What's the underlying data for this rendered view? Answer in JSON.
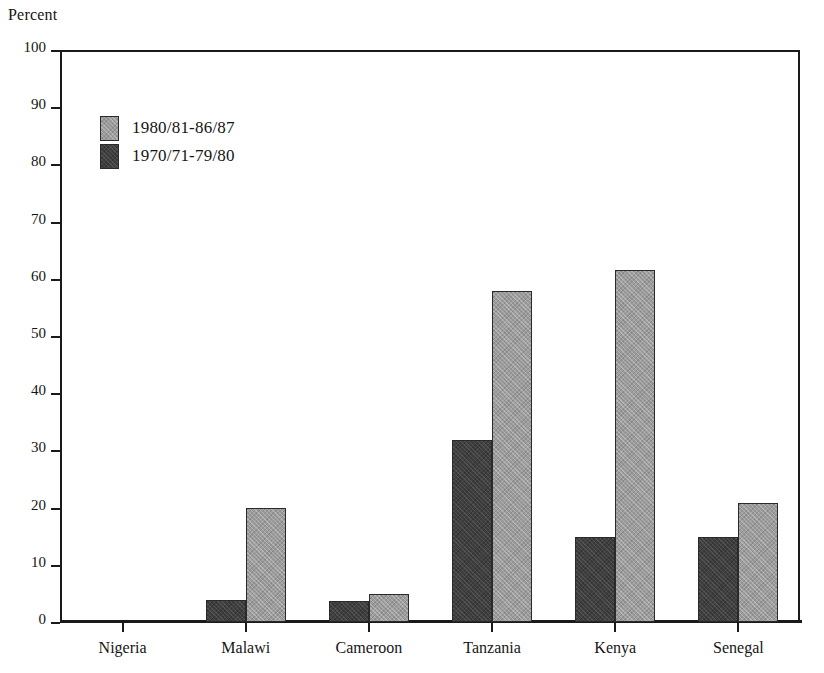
{
  "chart_data": {
    "type": "bar",
    "title": "",
    "subtitle": "",
    "ylabel": "Percent",
    "xlabel": "",
    "ylim": [
      0,
      100
    ],
    "ytick_step": 10,
    "yticks": [
      0,
      10,
      20,
      30,
      40,
      50,
      60,
      70,
      80,
      90,
      100
    ],
    "grid": false,
    "legend_position": "upper-left-inside",
    "categories": [
      "Nigeria",
      "Malawi",
      "Cameroon",
      "Tanzania",
      "Kenya",
      "Senegal"
    ],
    "series": [
      {
        "name": "1970/71-79/80",
        "key": "series-old",
        "color": "#3f3f3f",
        "values": [
          0,
          3.8,
          3.7,
          31.8,
          14.9,
          14.9
        ]
      },
      {
        "name": "1980/81-86/87",
        "key": "series-new",
        "color": "#9c9c9c",
        "values": [
          0,
          20.0,
          4.9,
          57.8,
          61.6,
          20.8
        ]
      }
    ],
    "annotations": []
  },
  "legend": {
    "entries": [
      {
        "label": "1980/81-86/87",
        "swatch": "series-new"
      },
      {
        "label": "1970/71-79/80",
        "swatch": "series-old"
      }
    ]
  },
  "colors": {
    "axis": "#1a1a1a",
    "background": "#ffffff",
    "series_new": "#9c9c9c",
    "series_old": "#3f3f3f"
  }
}
